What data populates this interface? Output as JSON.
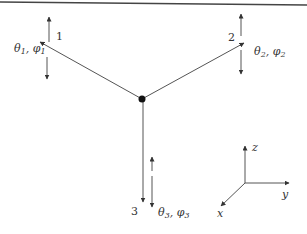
{
  "diagram": {
    "type": "three-member joint with rotational degrees of freedom",
    "colors": {
      "line": "#555555",
      "text": "#333333",
      "node": "#111111",
      "rule": "#444444"
    },
    "center_node": {
      "x": 142,
      "y": 99
    },
    "members": [
      {
        "id": "member-1",
        "label": "1",
        "dof_label": "θ1, φ1",
        "dof_theta": "θ",
        "dof_phi": "φ",
        "subscript": "1",
        "end": {
          "x": 40,
          "y": 42
        }
      },
      {
        "id": "member-2",
        "label": "2",
        "dof_label": "θ2, φ2",
        "dof_theta": "θ",
        "dof_phi": "φ",
        "subscript": "2",
        "end": {
          "x": 243,
          "y": 43
        }
      },
      {
        "id": "member-3",
        "label": "3",
        "dof_label": "θ3, φ3",
        "dof_theta": "θ",
        "dof_phi": "φ",
        "subscript": "3",
        "end": {
          "x": 143,
          "y": 200
        }
      }
    ],
    "axes": {
      "origin": {
        "x": 245,
        "y": 183
      },
      "x_label": "x",
      "y_label": "y",
      "z_label": "z"
    }
  }
}
